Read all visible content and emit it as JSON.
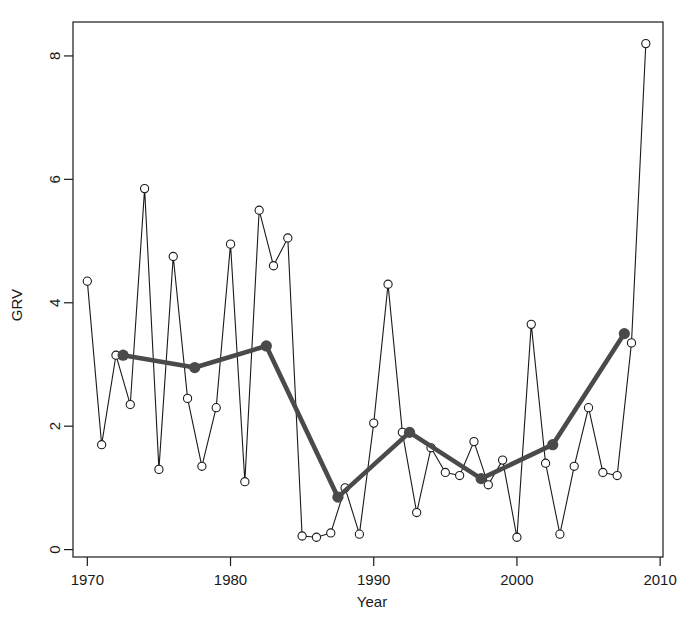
{
  "chart_data": {
    "type": "line",
    "title": "",
    "xlabel": "Year",
    "ylabel": "GRV",
    "xlim": [
      1969.0,
      2010.2
    ],
    "ylim": [
      -0.12,
      8.55
    ],
    "grid": false,
    "legend": "none",
    "xticks": [
      1970,
      1980,
      1990,
      2000,
      2010
    ],
    "xtick_labels": [
      "1970",
      "1980",
      "1990",
      "2000",
      "2010"
    ],
    "yticks": [
      0,
      2,
      4,
      6,
      8
    ],
    "ytick_labels": [
      "0",
      "2",
      "4",
      "6",
      "8"
    ],
    "series": [
      {
        "name": "annual-grv",
        "style": "thin-line-open-circles",
        "color": "#1a1a1a",
        "marker": "open-circle",
        "x": [
          1970,
          1971,
          1972,
          1973,
          1974,
          1975,
          1976,
          1977,
          1978,
          1979,
          1980,
          1981,
          1982,
          1983,
          1984,
          1985,
          1986,
          1987,
          1988,
          1989,
          1990,
          1991,
          1992,
          1993,
          1994,
          1995,
          1996,
          1997,
          1998,
          1999,
          2000,
          2001,
          2002,
          2003,
          2004,
          2005,
          2006,
          2007,
          2008,
          2009
        ],
        "values": [
          4.35,
          1.7,
          3.15,
          2.35,
          5.85,
          1.3,
          4.75,
          2.45,
          1.35,
          2.3,
          4.95,
          1.1,
          5.5,
          4.6,
          5.05,
          0.22,
          0.2,
          0.27,
          1.0,
          0.25,
          2.05,
          4.3,
          1.9,
          0.6,
          1.65,
          1.25,
          1.2,
          1.75,
          1.05,
          1.45,
          0.2,
          3.65,
          1.4,
          0.25,
          1.35,
          2.3,
          1.25,
          1.2,
          3.35,
          8.2
        ]
      },
      {
        "name": "five-year-trend",
        "style": "thick-line-filled-circles",
        "color": "#4a4a4a",
        "marker": "filled-circle",
        "x": [
          1972.5,
          1977.5,
          1982.5,
          1987.5,
          1992.5,
          1997.5,
          2002.5,
          2007.5
        ],
        "values": [
          3.15,
          2.95,
          3.3,
          0.85,
          1.9,
          1.15,
          1.7,
          3.5
        ]
      }
    ]
  },
  "axes": {
    "y_title": "GRV",
    "x_title": "Year"
  }
}
